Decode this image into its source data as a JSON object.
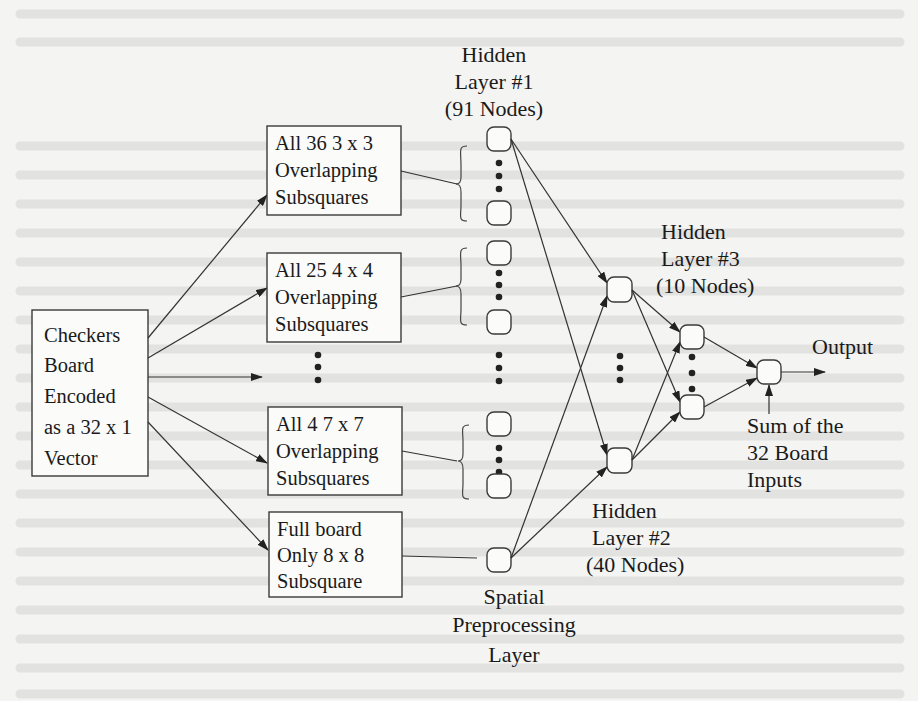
{
  "figure": {
    "input_box": {
      "lines": [
        "Checkers",
        "Board",
        "Encoded",
        "as a 32 x 1",
        "Vector"
      ]
    },
    "subsquare_boxes": [
      {
        "lines": [
          "All 36  3 x 3",
          "Overlapping",
          "Subsquares"
        ]
      },
      {
        "lines": [
          "All 25  4 x 4",
          "Overlapping",
          "Subsquares"
        ]
      },
      {
        "lines": [
          "All 4  7 x 7",
          "Overlapping",
          "Subsquares"
        ]
      },
      {
        "lines": [
          "Full board",
          "Only 8 x 8",
          "Subsquare"
        ]
      }
    ],
    "layers": {
      "hidden1": {
        "lines": [
          "Hidden",
          "Layer #1",
          "(91 Nodes)"
        ]
      },
      "hidden2": {
        "lines": [
          "Hidden",
          "Layer #2",
          "(40 Nodes)"
        ]
      },
      "hidden3": {
        "lines": [
          "Hidden",
          "Layer #3",
          "(10 Nodes)"
        ]
      },
      "spatial": {
        "lines": [
          "Spatial",
          "Preprocessing",
          "Layer"
        ]
      }
    },
    "output": {
      "label": "Output",
      "bias_lines": [
        "Sum of the",
        "32 Board",
        "Inputs"
      ]
    },
    "colors": {
      "ink": "#1a1a1a",
      "paper": "#f4f4f2"
    }
  }
}
